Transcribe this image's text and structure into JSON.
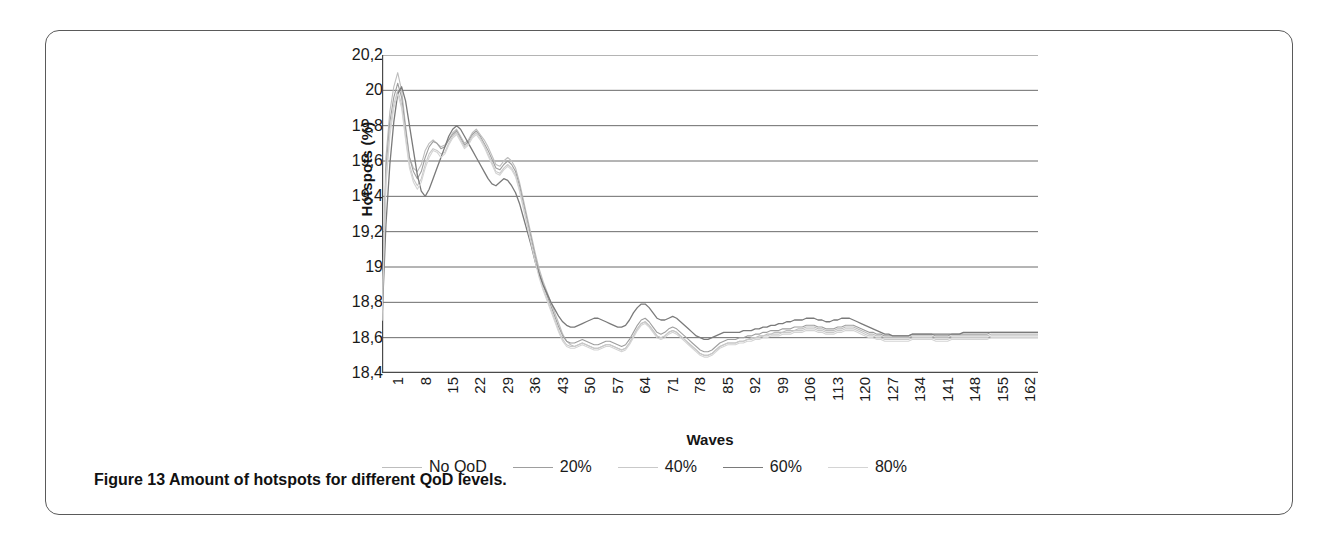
{
  "figure": {
    "caption_prefix": "Figure 13",
    "caption_text": " Amount of hotspots for different QoD levels."
  },
  "chart_data": {
    "type": "line",
    "title": "",
    "xlabel": "Waves",
    "ylabel": "Hotspots (%)",
    "xlim": [
      1,
      168
    ],
    "ylim": [
      18.4,
      20.2
    ],
    "ytick_labels": [
      "20,2",
      "20",
      "19,8",
      "19,6",
      "19,4",
      "19,2",
      "19",
      "18,8",
      "18,6",
      "18,4"
    ],
    "ytick_values": [
      20.2,
      20.0,
      19.8,
      19.6,
      19.4,
      19.2,
      19.0,
      18.8,
      18.6,
      18.4
    ],
    "xtick_labels": [
      "1",
      "8",
      "15",
      "22",
      "29",
      "36",
      "43",
      "50",
      "57",
      "64",
      "71",
      "78",
      "85",
      "92",
      "99",
      "106",
      "113",
      "120",
      "127",
      "134",
      "141",
      "148",
      "155",
      "162"
    ],
    "xtick_values": [
      1,
      8,
      15,
      22,
      29,
      36,
      43,
      50,
      57,
      64,
      71,
      78,
      85,
      92,
      99,
      106,
      113,
      120,
      127,
      134,
      141,
      148,
      155,
      162
    ],
    "grid": true,
    "grid_axis": "y",
    "legend_position": "bottom",
    "legend": [
      "No QoD",
      "20%",
      "40%",
      "60%",
      "80%"
    ],
    "series": [
      {
        "name": "No QoD",
        "color": "#bdbdbd",
        "values": [
          18.7,
          19.62,
          19.88,
          20.02,
          20.1,
          20.0,
          19.8,
          19.62,
          19.56,
          19.54,
          19.58,
          19.66,
          19.7,
          19.72,
          19.7,
          19.68,
          19.69,
          19.72,
          19.76,
          19.78,
          19.74,
          19.7,
          19.72,
          19.76,
          19.78,
          19.75,
          19.72,
          19.68,
          19.63,
          19.58,
          19.57,
          19.6,
          19.62,
          19.6,
          19.56,
          19.48,
          19.38,
          19.28,
          19.18,
          19.08,
          18.99,
          18.92,
          18.86,
          18.8,
          18.74,
          18.68,
          18.62,
          18.58,
          18.56,
          18.55,
          18.56,
          18.57,
          18.56,
          18.55,
          18.54,
          18.54,
          18.55,
          18.56,
          18.56,
          18.55,
          18.54,
          18.53,
          18.54,
          18.57,
          18.61,
          18.65,
          18.68,
          18.69,
          18.67,
          18.64,
          18.61,
          18.6,
          18.61,
          18.63,
          18.64,
          18.63,
          18.61,
          18.59,
          18.57,
          18.55,
          18.53,
          18.51,
          18.5,
          18.5,
          18.51,
          18.53,
          18.55,
          18.56,
          18.57,
          18.57,
          18.57,
          18.58,
          18.58,
          18.59,
          18.6,
          18.6,
          18.61,
          18.61,
          18.62,
          18.62,
          18.63,
          18.63,
          18.63,
          18.64,
          18.64,
          18.64,
          18.65,
          18.65,
          18.66,
          18.66,
          18.66,
          18.65,
          18.65,
          18.64,
          18.64,
          18.64,
          18.65,
          18.65,
          18.66,
          18.66,
          18.66,
          18.65,
          18.64,
          18.63,
          18.62,
          18.62,
          18.61,
          18.61,
          18.6,
          18.6,
          18.6,
          18.6,
          18.6,
          18.6,
          18.6,
          18.61,
          18.61,
          18.61,
          18.61,
          18.61,
          18.61,
          18.6,
          18.6,
          18.6,
          18.6,
          18.61,
          18.61,
          18.61,
          18.61,
          18.61,
          18.61,
          18.61,
          18.61,
          18.61,
          18.61,
          18.62,
          18.62,
          18.62,
          18.62,
          18.62,
          18.62,
          18.62,
          18.62,
          18.62,
          18.62,
          18.62,
          18.62,
          18.62
        ]
      },
      {
        "name": "20%",
        "color": "#9e9e9e",
        "values": [
          18.7,
          19.55,
          19.82,
          19.96,
          20.04,
          19.96,
          19.78,
          19.62,
          19.54,
          19.5,
          19.54,
          19.62,
          19.68,
          19.71,
          19.7,
          19.67,
          19.68,
          19.72,
          19.75,
          19.77,
          19.73,
          19.69,
          19.71,
          19.75,
          19.77,
          19.74,
          19.7,
          19.66,
          19.61,
          19.56,
          19.55,
          19.58,
          19.6,
          19.58,
          19.54,
          19.46,
          19.36,
          19.26,
          19.16,
          19.06,
          18.97,
          18.9,
          18.84,
          18.78,
          18.72,
          18.66,
          18.61,
          18.58,
          18.57,
          18.57,
          18.58,
          18.59,
          18.58,
          18.57,
          18.56,
          18.56,
          18.57,
          18.58,
          18.58,
          18.57,
          18.56,
          18.55,
          18.56,
          18.59,
          18.63,
          18.67,
          18.7,
          18.71,
          18.69,
          18.66,
          18.63,
          18.62,
          18.63,
          18.65,
          18.66,
          18.65,
          18.63,
          18.61,
          18.59,
          18.57,
          18.55,
          18.53,
          18.52,
          18.52,
          18.53,
          18.55,
          18.57,
          18.58,
          18.59,
          18.59,
          18.59,
          18.6,
          18.6,
          18.61,
          18.61,
          18.62,
          18.62,
          18.63,
          18.63,
          18.64,
          18.64,
          18.64,
          18.65,
          18.65,
          18.65,
          18.66,
          18.66,
          18.66,
          18.67,
          18.67,
          18.67,
          18.66,
          18.66,
          18.65,
          18.65,
          18.65,
          18.66,
          18.66,
          18.67,
          18.67,
          18.67,
          18.66,
          18.65,
          18.64,
          18.63,
          18.63,
          18.62,
          18.62,
          18.61,
          18.61,
          18.61,
          18.61,
          18.61,
          18.61,
          18.61,
          18.62,
          18.62,
          18.62,
          18.62,
          18.62,
          18.62,
          18.61,
          18.61,
          18.61,
          18.61,
          18.62,
          18.62,
          18.62,
          18.62,
          18.62,
          18.62,
          18.62,
          18.62,
          18.62,
          18.62,
          18.63,
          18.63,
          18.63,
          18.63,
          18.63,
          18.63,
          18.63,
          18.63,
          18.63,
          18.63,
          18.63,
          18.63,
          18.63
        ]
      },
      {
        "name": "40%",
        "color": "#c9c9c9",
        "values": [
          18.7,
          19.5,
          19.78,
          19.92,
          20.0,
          19.92,
          19.74,
          19.58,
          19.5,
          19.46,
          19.5,
          19.58,
          19.64,
          19.67,
          19.66,
          19.64,
          19.65,
          19.7,
          19.74,
          19.76,
          19.72,
          19.68,
          19.7,
          19.74,
          19.76,
          19.73,
          19.69,
          19.64,
          19.59,
          19.54,
          19.53,
          19.56,
          19.58,
          19.56,
          19.52,
          19.44,
          19.34,
          19.24,
          19.14,
          19.04,
          18.95,
          18.88,
          18.82,
          18.76,
          18.7,
          18.64,
          18.59,
          18.56,
          18.55,
          18.55,
          18.56,
          18.57,
          18.56,
          18.55,
          18.54,
          18.54,
          18.55,
          18.56,
          18.56,
          18.55,
          18.54,
          18.53,
          18.54,
          18.57,
          18.61,
          18.65,
          18.68,
          18.69,
          18.67,
          18.64,
          18.61,
          18.6,
          18.61,
          18.63,
          18.64,
          18.63,
          18.61,
          18.59,
          18.57,
          18.55,
          18.53,
          18.51,
          18.5,
          18.5,
          18.51,
          18.53,
          18.55,
          18.56,
          18.57,
          18.57,
          18.57,
          18.58,
          18.58,
          18.59,
          18.59,
          18.6,
          18.6,
          18.61,
          18.61,
          18.62,
          18.62,
          18.62,
          18.63,
          18.63,
          18.63,
          18.64,
          18.64,
          18.64,
          18.65,
          18.65,
          18.65,
          18.64,
          18.64,
          18.63,
          18.63,
          18.63,
          18.64,
          18.64,
          18.65,
          18.65,
          18.65,
          18.64,
          18.63,
          18.62,
          18.61,
          18.61,
          18.6,
          18.6,
          18.59,
          18.59,
          18.59,
          18.59,
          18.59,
          18.59,
          18.59,
          18.6,
          18.6,
          18.6,
          18.6,
          18.6,
          18.6,
          18.59,
          18.59,
          18.59,
          18.59,
          18.6,
          18.6,
          18.6,
          18.6,
          18.6,
          18.6,
          18.6,
          18.6,
          18.6,
          18.6,
          18.61,
          18.61,
          18.61,
          18.61,
          18.61,
          18.61,
          18.61,
          18.61,
          18.61,
          18.61,
          18.61,
          18.61,
          18.61
        ]
      },
      {
        "name": "60%",
        "color": "#7a7a7a",
        "values": [
          18.7,
          19.24,
          19.58,
          19.82,
          19.98,
          20.02,
          19.94,
          19.8,
          19.66,
          19.52,
          19.43,
          19.4,
          19.44,
          19.5,
          19.56,
          19.62,
          19.68,
          19.74,
          19.78,
          19.8,
          19.78,
          19.74,
          19.7,
          19.66,
          19.62,
          19.58,
          19.54,
          19.5,
          19.47,
          19.46,
          19.48,
          19.5,
          19.49,
          19.46,
          19.42,
          19.36,
          19.28,
          19.2,
          19.12,
          19.03,
          18.96,
          18.9,
          18.85,
          18.8,
          18.76,
          18.72,
          18.69,
          18.67,
          18.66,
          18.66,
          18.67,
          18.68,
          18.69,
          18.7,
          18.71,
          18.71,
          18.7,
          18.69,
          18.68,
          18.67,
          18.66,
          18.66,
          18.67,
          18.7,
          18.74,
          18.77,
          18.79,
          18.79,
          18.77,
          18.74,
          18.71,
          18.7,
          18.7,
          18.71,
          18.72,
          18.71,
          18.69,
          18.67,
          18.65,
          18.63,
          18.61,
          18.6,
          18.59,
          18.59,
          18.6,
          18.61,
          18.62,
          18.63,
          18.63,
          18.63,
          18.63,
          18.63,
          18.64,
          18.64,
          18.64,
          18.65,
          18.65,
          18.66,
          18.66,
          18.67,
          18.67,
          18.68,
          18.68,
          18.69,
          18.69,
          18.7,
          18.7,
          18.7,
          18.71,
          18.71,
          18.71,
          18.7,
          18.7,
          18.69,
          18.69,
          18.7,
          18.7,
          18.71,
          18.71,
          18.71,
          18.7,
          18.69,
          18.68,
          18.67,
          18.66,
          18.65,
          18.64,
          18.63,
          18.62,
          18.62,
          18.61,
          18.61,
          18.61,
          18.61,
          18.61,
          18.62,
          18.62,
          18.62,
          18.62,
          18.62,
          18.62,
          18.62,
          18.62,
          18.62,
          18.62,
          18.62,
          18.62,
          18.62,
          18.63,
          18.63,
          18.63,
          18.63,
          18.63,
          18.63,
          18.63,
          18.63,
          18.63,
          18.63,
          18.63,
          18.63,
          18.63,
          18.63,
          18.63,
          18.63,
          18.63,
          18.63,
          18.63,
          18.63,
          18.63
        ]
      },
      {
        "name": "80%",
        "color": "#d4d4d4",
        "values": [
          18.7,
          19.46,
          19.74,
          19.9,
          19.98,
          19.9,
          19.72,
          19.56,
          19.48,
          19.44,
          19.48,
          19.56,
          19.62,
          19.66,
          19.65,
          19.62,
          19.64,
          19.69,
          19.73,
          19.75,
          19.71,
          19.67,
          19.69,
          19.73,
          19.75,
          19.72,
          19.68,
          19.63,
          19.58,
          19.53,
          19.52,
          19.55,
          19.57,
          19.55,
          19.51,
          19.43,
          19.33,
          19.23,
          19.13,
          19.03,
          18.94,
          18.87,
          18.81,
          18.75,
          18.69,
          18.63,
          18.58,
          18.55,
          18.54,
          18.54,
          18.55,
          18.56,
          18.55,
          18.54,
          18.53,
          18.53,
          18.54,
          18.55,
          18.55,
          18.54,
          18.53,
          18.52,
          18.53,
          18.56,
          18.6,
          18.64,
          18.67,
          18.68,
          18.66,
          18.63,
          18.6,
          18.59,
          18.6,
          18.62,
          18.63,
          18.62,
          18.6,
          18.58,
          18.56,
          18.54,
          18.52,
          18.5,
          18.49,
          18.49,
          18.5,
          18.52,
          18.54,
          18.55,
          18.56,
          18.56,
          18.56,
          18.57,
          18.57,
          18.58,
          18.58,
          18.59,
          18.59,
          18.6,
          18.6,
          18.61,
          18.61,
          18.61,
          18.62,
          18.62,
          18.62,
          18.63,
          18.63,
          18.63,
          18.64,
          18.64,
          18.64,
          18.63,
          18.63,
          18.62,
          18.62,
          18.62,
          18.63,
          18.63,
          18.64,
          18.64,
          18.64,
          18.63,
          18.62,
          18.61,
          18.6,
          18.6,
          18.59,
          18.59,
          18.58,
          18.58,
          18.58,
          18.58,
          18.58,
          18.58,
          18.58,
          18.59,
          18.59,
          18.59,
          18.59,
          18.59,
          18.59,
          18.58,
          18.58,
          18.58,
          18.58,
          18.59,
          18.59,
          18.59,
          18.59,
          18.59,
          18.59,
          18.59,
          18.59,
          18.59,
          18.59,
          18.6,
          18.6,
          18.6,
          18.6,
          18.6,
          18.6,
          18.6,
          18.6,
          18.6,
          18.6,
          18.6,
          18.6,
          18.6
        ]
      }
    ]
  }
}
